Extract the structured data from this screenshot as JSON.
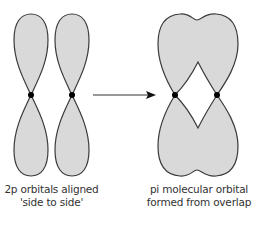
{
  "diagram": {
    "left": {
      "caption_line1": "2p orbitals aligned",
      "caption_line2": "'side to side'"
    },
    "right": {
      "caption_line1": "pi molecular orbital",
      "caption_line2": "formed from overlap"
    },
    "colors": {
      "lobe_fill": "#d9d9d9",
      "outline": "#3a3a3a",
      "node": "#000000",
      "arrow": "#333333"
    }
  }
}
